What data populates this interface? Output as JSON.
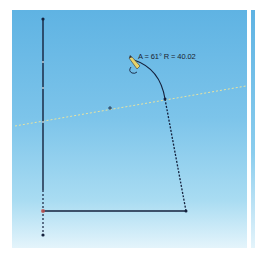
{
  "viewport": {
    "background": "#ffffff",
    "canvas_gradient_top": "#5fb3e3",
    "canvas_gradient_bottom": "#e4f4fb"
  },
  "sketch": {
    "dimension_label": "A = 61° R = 40.02",
    "line_color": "#14213d",
    "inference_line_color": "#e8e3a0",
    "origin_marker": "+",
    "cursor_icon": "pencil-arc-cursor"
  }
}
